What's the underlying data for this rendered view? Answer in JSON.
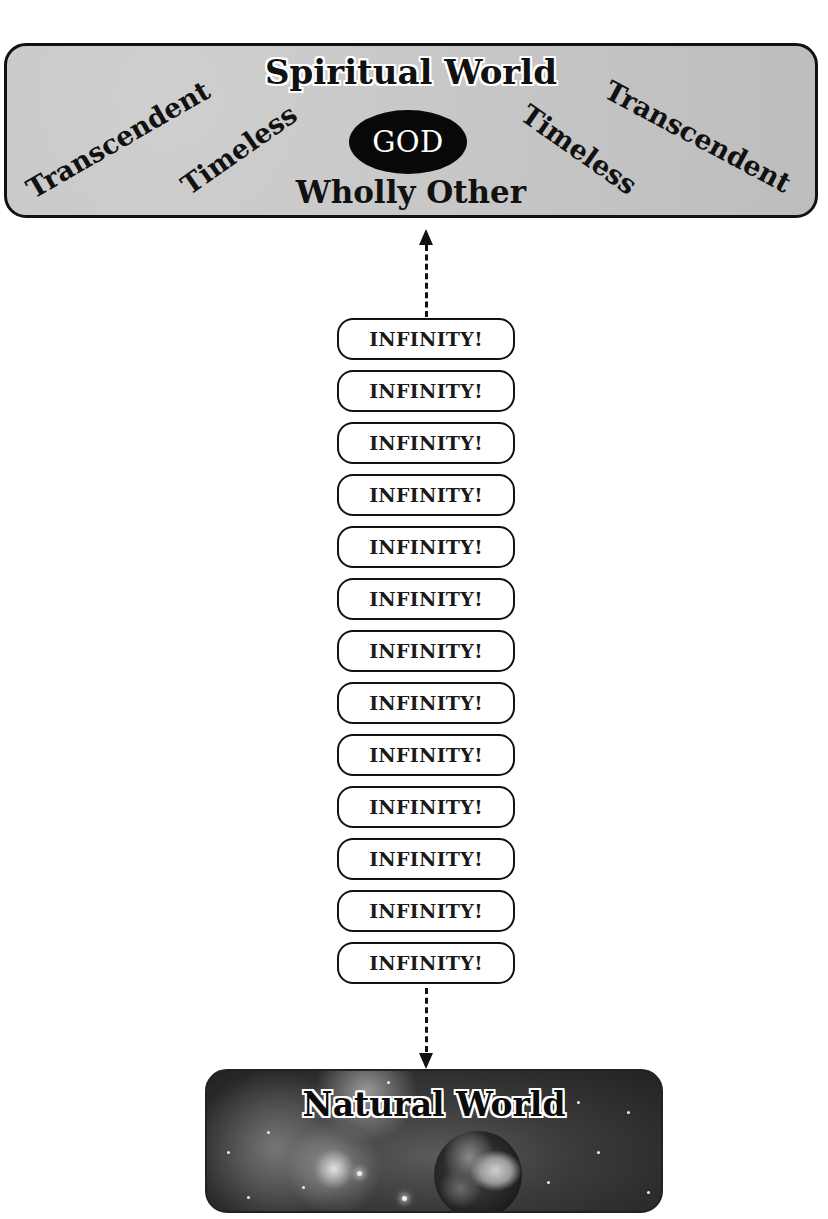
{
  "spiritual_world": {
    "title": "Spiritual World",
    "center_label": "GOD",
    "subtitle": "Wholly Other",
    "attributes": {
      "left_outer": "Transcendent",
      "left_inner": "Timeless",
      "right_inner": "Timeless",
      "right_outer": "Transcendent"
    },
    "background_color": "#c4c4c4",
    "god_oval_color": "#080808"
  },
  "connector": {
    "style": "dashed",
    "top_arrow": "up",
    "bottom_arrow": "down"
  },
  "infinity_stack": {
    "items": [
      "INFINITY!",
      "INFINITY!",
      "INFINITY!",
      "INFINITY!",
      "INFINITY!",
      "INFINITY!",
      "INFINITY!",
      "INFINITY!",
      "INFINITY!",
      "INFINITY!",
      "INFINITY!",
      "INFINITY!",
      "INFINITY!"
    ]
  },
  "natural_world": {
    "title": "Natural World",
    "background": "starfield-with-earth"
  }
}
